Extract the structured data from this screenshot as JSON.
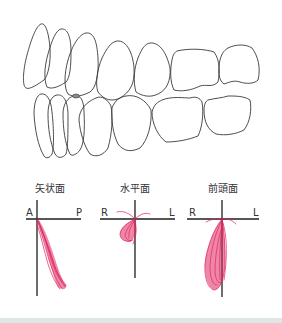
{
  "figure": {
    "type": "dental-occlusion-and-mandibular-movement-diagram",
    "teeth_illustration": {
      "view": "lateral (buccal) view of upper and lower dentition",
      "upper_teeth_count": 7,
      "lower_teeth_count": 7
    },
    "colors": {
      "outline": "#3a3a3a",
      "axis": "#1e1e1e",
      "trace": "#e0245e",
      "footer": "#dfe6e6"
    },
    "panels": [
      {
        "id": "sagittal",
        "title": "矢状面",
        "axis_left": "A",
        "axis_right": "P",
        "trace_description": "narrow band descending posteriorly-downward"
      },
      {
        "id": "horizontal",
        "title": "水平面",
        "axis_left": "R",
        "axis_right": "L",
        "trace_description": "small fan-shaped loop below-left of origin"
      },
      {
        "id": "frontal",
        "title": "前頭面",
        "axis_left": "R",
        "axis_right": "L",
        "trace_description": "elongated teardrop descending, slightly to the right side (R)"
      }
    ]
  }
}
